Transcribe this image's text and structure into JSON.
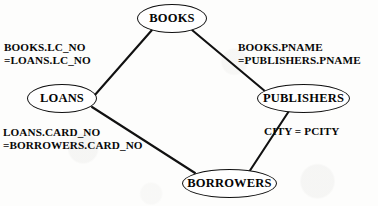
{
  "diagram": {
    "background_color": "#fdfdfc",
    "stroke_color": "#111111",
    "text_color": "#050505",
    "nodes": [
      {
        "id": "books",
        "label": "BOOKS"
      },
      {
        "id": "loans",
        "label": "LOANS"
      },
      {
        "id": "publishers",
        "label": "PUBLISHERS"
      },
      {
        "id": "borrowers",
        "label": "BORROWERS"
      }
    ],
    "edges": [
      {
        "id": "books-loans",
        "from": "BOOKS",
        "to": "LOANS",
        "label_line1": "BOOKS.LC_NO",
        "label_line2": "=LOANS.LC_NO"
      },
      {
        "id": "books-publishers",
        "from": "BOOKS",
        "to": "PUBLISHERS",
        "label_line1": "BOOKS.PNAME",
        "label_line2": "=PUBLISHERS.PNAME"
      },
      {
        "id": "loans-borrowers",
        "from": "LOANS",
        "to": "BORROWERS",
        "label_line1": "LOANS.CARD_NO",
        "label_line2": "=BORROWERS.CARD_NO"
      },
      {
        "id": "publishers-borrowers",
        "from": "PUBLISHERS",
        "to": "BORROWERS",
        "label_line1": "CITY = PCITY",
        "label_line2": ""
      }
    ]
  }
}
